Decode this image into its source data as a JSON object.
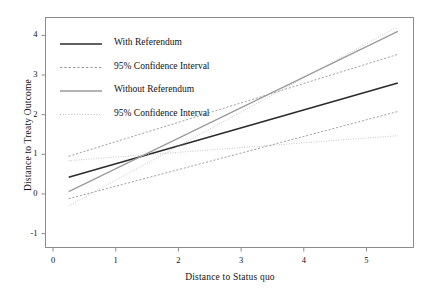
{
  "chart_data": {
    "type": "line",
    "title": "",
    "xlabel": "Distance to Status quo",
    "ylabel": "Distance to Treaty Outcome",
    "xlim": [
      -0.12,
      5.75
    ],
    "ylim": [
      -1.35,
      4.45
    ],
    "xticks": [
      0,
      1,
      2,
      3,
      4,
      5
    ],
    "xticklabels": [
      "0",
      "1",
      "2",
      "3",
      "4",
      "5"
    ],
    "yticks": [
      -1,
      0,
      1,
      2,
      3,
      4
    ],
    "yticklabels": [
      "-1",
      "0",
      "1",
      "2",
      "3",
      "4"
    ],
    "grid": false,
    "legend_position": "upper-left-inside",
    "series": [
      {
        "name": "With Referendum",
        "style": "solid",
        "color": "#2b2b2b",
        "width": 1.6,
        "x": [
          0.25,
          5.5
        ],
        "y": [
          0.42,
          2.8
        ]
      },
      {
        "name": "With Referendum 95% CI upper",
        "style": "dashed",
        "color": "#8a8a8a",
        "width": 0.8,
        "x": [
          0.25,
          5.5
        ],
        "y": [
          0.95,
          3.52
        ]
      },
      {
        "name": "With Referendum 95% CI lower",
        "style": "dashed",
        "color": "#8a8a8a",
        "width": 0.8,
        "x": [
          0.25,
          5.5
        ],
        "y": [
          -0.12,
          2.08
        ]
      },
      {
        "name": "Without Referendum",
        "style": "solid",
        "color": "#9a9a9a",
        "width": 1.2,
        "x": [
          0.25,
          5.5
        ],
        "y": [
          0.06,
          4.1
        ]
      },
      {
        "name": "Without Referendum 95% CI upper",
        "style": "dotted",
        "color": "#b0b0b0",
        "width": 0.8,
        "x": [
          0.25,
          5.5
        ],
        "y": [
          -0.3,
          4.22
        ]
      },
      {
        "name": "Without Referendum 95% CI lower",
        "style": "dotted",
        "color": "#b0b0b0",
        "width": 0.8,
        "x": [
          0.25,
          5.5
        ],
        "y": [
          0.84,
          1.47
        ]
      }
    ]
  },
  "legend": {
    "entries": [
      {
        "label": "With Referendum",
        "color": "#2b2b2b",
        "style": "solid",
        "width": 1.7
      },
      {
        "label": "95% Confidence Interval",
        "color": "#8a8a8a",
        "style": "dashed",
        "width": 0.9
      },
      {
        "label": "Without Referendum",
        "color": "#9a9a9a",
        "style": "solid",
        "width": 1.3
      },
      {
        "label": "95% Confidence Interval",
        "color": "#b8b8b8",
        "style": "dotted",
        "width": 0.9
      }
    ]
  },
  "frame": {
    "color": "#8c8c8c"
  }
}
